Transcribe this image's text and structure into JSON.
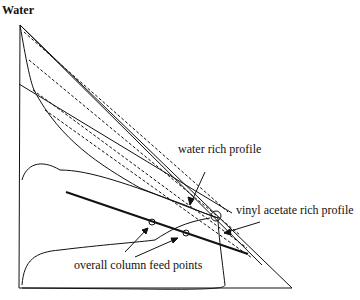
{
  "title": "Water",
  "labels": {
    "water_rich": "water rich profile",
    "vinyl_acetate_rich": "vinyl acetate rich profile",
    "feed_points": "overall column feed points"
  },
  "colors": {
    "line": "#111111",
    "background": "#ffffff"
  }
}
